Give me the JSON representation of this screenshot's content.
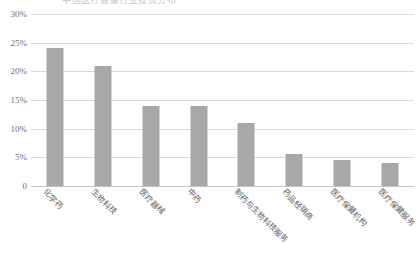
{
  "chart_data": {
    "type": "bar",
    "title": "中国医疗健康行业投资分布",
    "xlabel": "",
    "ylabel": "",
    "categories": [
      "化学药",
      "生物科技",
      "医疗器械",
      "中药",
      "制药与生物科技服务",
      "药品经销商",
      "医疗保健机构",
      "医疗保健服务"
    ],
    "values": [
      24,
      21,
      14,
      14,
      11,
      5.5,
      4.6,
      4.1
    ],
    "ylim": [
      0,
      30
    ],
    "ytick_labels": [
      "0",
      "5%",
      "10%",
      "15%",
      "20%",
      "25%",
      "30%"
    ],
    "ytick_values": [
      0,
      5,
      10,
      15,
      20,
      25,
      30
    ],
    "grid": true,
    "legend": false,
    "bar_color": "#a8a8a8",
    "grid_color": "#d9d9d9",
    "background": "#ffffff"
  }
}
